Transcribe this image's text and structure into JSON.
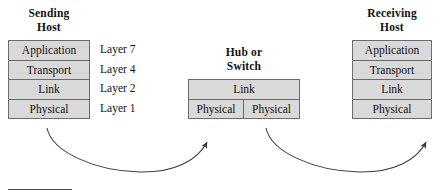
{
  "diagram": {
    "colors": {
      "box_fill": "#d9d9d9",
      "box_border": "#6b6b6b",
      "text": "#111111",
      "arrow": "#3a3a3a",
      "rule": "#4a4a4a"
    }
  },
  "sending_host": {
    "heading_line1": "Sending",
    "heading_line2": "Host",
    "layers": [
      {
        "label": "Application"
      },
      {
        "label": "Transport"
      },
      {
        "label": "Link"
      },
      {
        "label": "Physical"
      }
    ]
  },
  "layer_numbers": [
    {
      "label": "Layer 7"
    },
    {
      "label": "Layer 4"
    },
    {
      "label": "Layer 2"
    },
    {
      "label": "Layer 1"
    }
  ],
  "device": {
    "heading_line1": "Hub or",
    "heading_line2": "Switch",
    "link_layer": "Link",
    "physical_left": "Physical",
    "physical_right": "Physical"
  },
  "receiving_host": {
    "heading_line1": "Receiving",
    "heading_line2": "Host",
    "layers": [
      {
        "label": "Application"
      },
      {
        "label": "Transport"
      },
      {
        "label": "Link"
      },
      {
        "label": "Physical"
      }
    ]
  },
  "arrows": [
    {
      "name": "arrow-sending-to-device",
      "from": "sending host physical layer",
      "to": "device left physical layer"
    },
    {
      "name": "arrow-device-to-receiving",
      "from": "device right physical layer",
      "to": "receiving host physical layer"
    }
  ]
}
